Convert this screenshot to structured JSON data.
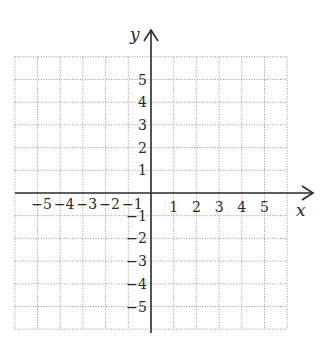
{
  "chart_data": {
    "type": "scatter",
    "title": "",
    "xlabel": "x",
    "ylabel": "y",
    "xlim": [
      -6,
      6
    ],
    "ylim": [
      -6,
      6
    ],
    "grid": true,
    "grid_style": "dotted",
    "x_tick_labels": [
      "−5",
      "−4",
      "−3",
      "−2",
      "−1",
      "1",
      "2",
      "3",
      "4",
      "5"
    ],
    "y_tick_labels": [
      "5",
      "4",
      "3",
      "2",
      "1",
      "−1",
      "−2",
      "−3",
      "−4",
      "−5"
    ],
    "x_ticks": [
      -5,
      -4,
      -3,
      -2,
      -1,
      1,
      2,
      3,
      4,
      5
    ],
    "y_ticks": [
      5,
      4,
      3,
      2,
      1,
      -1,
      -2,
      -3,
      -4,
      -5
    ],
    "series": [],
    "legend": null
  },
  "axes": {
    "x_label": "x",
    "y_label": "y"
  }
}
